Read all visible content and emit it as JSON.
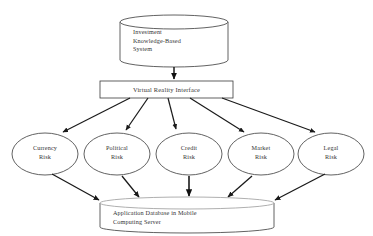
{
  "diagram": {
    "colors": {
      "stroke": "#3a3a3a",
      "text": "#333333",
      "background": "#ffffff",
      "arrow": "#1a1a1a"
    },
    "nodes": {
      "knowledge_base": {
        "shape": "cylinder",
        "label": "Investment\nKnowledge-Based\nSystem"
      },
      "interface": {
        "shape": "rectangle",
        "label": "Virtual Reality Interface"
      },
      "database": {
        "shape": "cylinder",
        "label": "Application Database in Mobile\nComputing Server"
      }
    },
    "risks": [
      {
        "id": "currency",
        "label": "Currency\nRisk"
      },
      {
        "id": "political",
        "label": "Political\nRisk"
      },
      {
        "id": "credit",
        "label": "Credit\nRisk"
      },
      {
        "id": "market",
        "label": "Market\nRisk"
      },
      {
        "id": "legal",
        "label": "Legal\nRisk"
      }
    ],
    "edges": [
      {
        "from": "knowledge_base",
        "to": "interface"
      },
      {
        "from": "interface",
        "to": "currency"
      },
      {
        "from": "interface",
        "to": "political"
      },
      {
        "from": "interface",
        "to": "credit"
      },
      {
        "from": "interface",
        "to": "market"
      },
      {
        "from": "interface",
        "to": "legal"
      },
      {
        "from": "currency",
        "to": "database"
      },
      {
        "from": "political",
        "to": "database"
      },
      {
        "from": "credit",
        "to": "database"
      },
      {
        "from": "market",
        "to": "database"
      },
      {
        "from": "legal",
        "to": "database"
      }
    ]
  }
}
